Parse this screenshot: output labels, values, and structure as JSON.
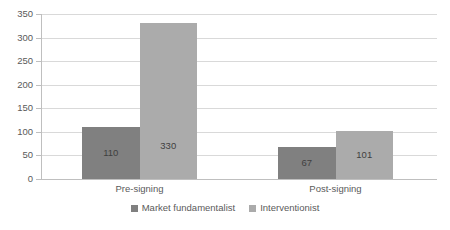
{
  "chart_data": {
    "type": "bar",
    "title": "",
    "subtitle": "",
    "xlabel": "",
    "ylabel": "",
    "categories": [
      "Pre-signing",
      "Post-signing"
    ],
    "series": [
      {
        "name": "Market fundamentalist",
        "color": "#808080",
        "values": [
          110,
          67
        ]
      },
      {
        "name": "Interventionist",
        "color": "#ababab",
        "values": [
          330,
          101
        ]
      }
    ],
    "ylim": [
      0,
      350
    ],
    "ytick_step": 50,
    "yticks": [
      0,
      50,
      100,
      150,
      200,
      250,
      300,
      350
    ],
    "ytick_labels": [
      "0",
      "50",
      "100",
      "150",
      "200",
      "250",
      "300",
      "350"
    ],
    "data_labels": [
      [
        "110",
        "67"
      ],
      [
        "330",
        "101"
      ]
    ],
    "grid": true,
    "grid_axis": "y",
    "legend_position": "bottom",
    "background": "#ffffff",
    "grid_color": "#d9d9d9",
    "axis_color": "#bfbfbf"
  }
}
